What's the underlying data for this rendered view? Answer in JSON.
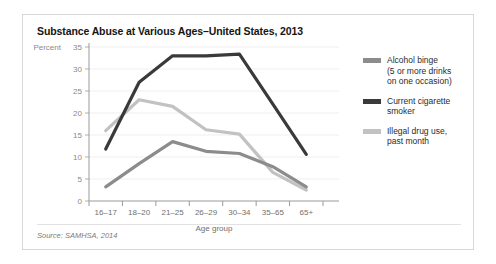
{
  "figure": {
    "title": "Substance Abuse at Various Ages–United States, 2013",
    "source": "Source: SAMHSA, 2014"
  },
  "legend": {
    "items": [
      {
        "label": "Alcohol binge (5 or more drinks on one occasion)",
        "line1": "Alcohol binge",
        "line2": "(5 or more drinks",
        "line3": "on one occasion)",
        "color": "#8c8c8c"
      },
      {
        "label": "Current cigarette smoker",
        "line1": "Current cigarette",
        "line2": "smoker",
        "line3": "",
        "color": "#3a3a3a"
      },
      {
        "label": "Illegal drug use, past month",
        "line1": "Illegal drug use,",
        "line2": "past month",
        "line3": "",
        "color": "#c2c2c2"
      }
    ]
  },
  "chart_data": {
    "type": "line",
    "title": "Substance Abuse at Various Ages–United States, 2013",
    "xlabel": "Age group",
    "ylabel": "Percent",
    "categories": [
      "16–17",
      "18–20",
      "21–25",
      "26–29",
      "30–34",
      "35–65",
      "65+"
    ],
    "yticks": [
      0,
      5,
      10,
      15,
      20,
      25,
      30,
      35
    ],
    "ylim": [
      0,
      35
    ],
    "grid": true,
    "legend_position": "right",
    "series": [
      {
        "name": "Alcohol binge (5 or more drinks on one occasion)",
        "color": "#8c8c8c",
        "values": [
          3.2,
          8.5,
          13.5,
          11.3,
          10.8,
          7.8,
          3.2
        ]
      },
      {
        "name": "Current cigarette smoker",
        "color": "#3a3a3a",
        "values": [
          11.8,
          27.0,
          33.0,
          33.0,
          33.4,
          22.0,
          10.6
        ]
      },
      {
        "name": "Illegal drug use, past month",
        "color": "#c2c2c2",
        "values": [
          16.0,
          23.0,
          21.5,
          16.2,
          15.2,
          6.5,
          2.5
        ]
      }
    ]
  }
}
